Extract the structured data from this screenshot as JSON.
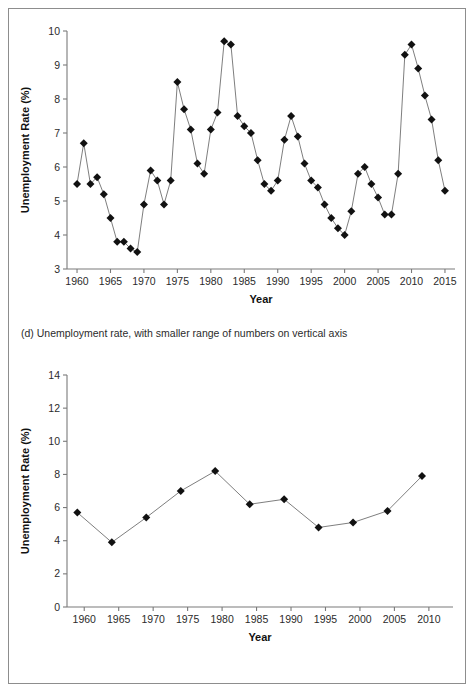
{
  "figure": {
    "background_color": "#ffffff",
    "frame_color": "#8d8d8d",
    "marker_color": "#111111",
    "line_color": "#6f6f6f",
    "axis_color": "#7a7a7a"
  },
  "panels": [
    {
      "key": "d",
      "caption": "(d) Unemployment rate, with smaller range of numbers on vertical axis",
      "xlabel": "Year",
      "ylabel": "Unemployment Rate (%)"
    },
    {
      "key": "e",
      "caption": "(e) Unemployment rate, five-year averages",
      "xlabel": "Year",
      "ylabel": "Unemployment Rate (%)"
    }
  ],
  "chart_data": [
    {
      "type": "line",
      "title": "(d) Unemployment rate, with smaller range of numbers on vertical axis",
      "xlabel": "Year",
      "ylabel": "Unemployment Rate (%)",
      "xlim": [
        1958.5,
        2016.5
      ],
      "ylim": [
        3,
        10
      ],
      "xticks": [
        1960,
        1965,
        1970,
        1975,
        1980,
        1985,
        1990,
        1995,
        2000,
        2005,
        2010,
        2015
      ],
      "yticks": [
        3,
        4,
        5,
        6,
        7,
        8,
        9,
        10
      ],
      "grid": false,
      "legend": null,
      "marker": "diamond",
      "x": [
        1960,
        1961,
        1962,
        1963,
        1964,
        1965,
        1966,
        1967,
        1968,
        1969,
        1970,
        1971,
        1972,
        1973,
        1974,
        1975,
        1976,
        1977,
        1978,
        1979,
        1980,
        1981,
        1982,
        1983,
        1984,
        1985,
        1986,
        1987,
        1988,
        1989,
        1990,
        1991,
        1992,
        1993,
        1994,
        1995,
        1996,
        1997,
        1998,
        1999,
        2000,
        2001,
        2002,
        2003,
        2004,
        2005,
        2006,
        2007,
        2008,
        2009,
        2010,
        2011,
        2012,
        2013,
        2014,
        2015
      ],
      "values": [
        5.5,
        6.7,
        5.5,
        5.7,
        5.2,
        4.5,
        3.8,
        3.8,
        3.6,
        3.5,
        4.9,
        5.9,
        5.6,
        4.9,
        5.6,
        8.5,
        7.7,
        7.1,
        6.1,
        5.8,
        7.1,
        7.6,
        9.7,
        9.6,
        7.5,
        7.2,
        7.0,
        6.2,
        5.5,
        5.3,
        5.6,
        6.8,
        7.5,
        6.9,
        6.1,
        5.6,
        5.4,
        4.9,
        4.5,
        4.2,
        4.0,
        4.7,
        5.8,
        6.0,
        5.5,
        5.1,
        4.6,
        4.6,
        5.8,
        9.3,
        9.6,
        8.9,
        8.1,
        7.4,
        6.2,
        5.3
      ],
      "series": [
        {
          "name": "Unemployment Rate (%)",
          "values": [
            5.5,
            6.7,
            5.5,
            5.7,
            5.2,
            4.5,
            3.8,
            3.8,
            3.6,
            3.5,
            4.9,
            5.9,
            5.6,
            4.9,
            5.6,
            8.5,
            7.7,
            7.1,
            6.1,
            5.8,
            7.1,
            7.6,
            9.7,
            9.6,
            7.5,
            7.2,
            7.0,
            6.2,
            5.5,
            5.3,
            5.6,
            6.8,
            7.5,
            6.9,
            6.1,
            5.6,
            5.4,
            4.9,
            4.5,
            4.2,
            4.0,
            4.7,
            5.8,
            6.0,
            5.5,
            5.1,
            4.6,
            4.6,
            5.8,
            9.3,
            9.6,
            8.9,
            8.1,
            7.4,
            6.2,
            5.3
          ]
        }
      ]
    },
    {
      "type": "line",
      "title": "(e) Unemployment rate, five-year averages",
      "xlabel": "Year",
      "ylabel": "Unemployment Rate (%)",
      "xlim": [
        1957.5,
        2013.5
      ],
      "ylim": [
        0,
        14
      ],
      "xticks": [
        1960,
        1965,
        1970,
        1975,
        1980,
        1985,
        1990,
        1995,
        2000,
        2005,
        2010
      ],
      "yticks": [
        0,
        2,
        4,
        6,
        8,
        10,
        12,
        14
      ],
      "grid": false,
      "legend": null,
      "marker": "diamond",
      "x": [
        1959,
        1964,
        1969,
        1974,
        1979,
        1984,
        1989,
        1994,
        1999,
        2004,
        2009
      ],
      "values": [
        5.7,
        3.9,
        5.4,
        7.0,
        8.2,
        6.2,
        6.5,
        4.8,
        5.1,
        5.8,
        7.9
      ],
      "series": [
        {
          "name": "Unemployment Rate (%), five-year averages",
          "values": [
            5.7,
            3.9,
            5.4,
            7.0,
            8.2,
            6.2,
            6.5,
            4.8,
            5.1,
            5.8,
            7.9
          ]
        }
      ]
    }
  ]
}
